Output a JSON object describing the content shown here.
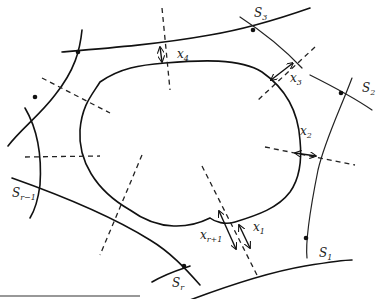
{
  "figure": {
    "labels": {
      "S3": {
        "main": "S",
        "sub": "3"
      },
      "S2": {
        "main": "S",
        "sub": "2"
      },
      "S1": {
        "main": "S",
        "sub": "1"
      },
      "Sr": {
        "main": "S",
        "sub": "r"
      },
      "Sr1": {
        "main": "S",
        "sub": "r−1"
      },
      "x1": {
        "main": "x",
        "sub": "1"
      },
      "x2": {
        "main": "x",
        "sub": "2"
      },
      "x3": {
        "main": "x",
        "sub": "3"
      },
      "x4": {
        "main": "x",
        "sub": "4"
      },
      "xr1": {
        "main": "x",
        "sub": "r+1"
      }
    },
    "colors": {
      "ink": "#111111",
      "background": "#ffffff"
    }
  }
}
